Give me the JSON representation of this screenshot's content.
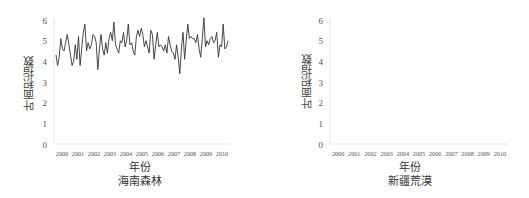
{
  "chart_data": [
    {
      "type": "line",
      "title": "海南森林",
      "xlabel": "年份",
      "ylabel": "叶面积指数",
      "ylim": [
        0,
        6
      ],
      "yticks": [
        0,
        1,
        2,
        3,
        4,
        5,
        6
      ],
      "categories": [
        "2000",
        "2001",
        "2002",
        "2003",
        "2004",
        "2005",
        "2006",
        "2007",
        "2008",
        "2009",
        "2010"
      ],
      "grid": false,
      "legend": null,
      "series": [
        {
          "name": "叶面积指数",
          "color": "#333333",
          "values": [
            4.3,
            3.8,
            4.2,
            5.1,
            4.6,
            4.5,
            4.9,
            5.3,
            4.8,
            4.3,
            3.8,
            4.0,
            4.8,
            4.1,
            5.2,
            3.8,
            4.6,
            5.4,
            5.8,
            4.5,
            4.9,
            4.6,
            4.8,
            5.3,
            5.2,
            4.9,
            3.6,
            4.6,
            5.3,
            4.6,
            4.3,
            4.9,
            4.4,
            5.1,
            5.4,
            5.0,
            5.9,
            4.8,
            4.6,
            4.4,
            5.0,
            4.9,
            5.4,
            4.7,
            5.0,
            5.8,
            4.8,
            4.9,
            4.5,
            4.3,
            5.2,
            5.5,
            5.2,
            5.6,
            5.3,
            4.7,
            5.0,
            4.7,
            4.4,
            5.5,
            5.3,
            4.1,
            4.8,
            5.4,
            4.7,
            4.8,
            4.7,
            4.5,
            4.8,
            4.4,
            5.2,
            4.8,
            4.5,
            4.4,
            4.1,
            4.8,
            4.2,
            3.4,
            4.6,
            5.4,
            4.1,
            5.0,
            5.8,
            5.1,
            5.2,
            5.1,
            5.1,
            4.9,
            5.3,
            4.6,
            4.2,
            5.1,
            6.1,
            4.7,
            5.0,
            4.8,
            5.1,
            5.2,
            4.9,
            5.0,
            5.4,
            4.2,
            4.8,
            4.7,
            5.8,
            4.6,
            4.7,
            5.0
          ]
        }
      ]
    },
    {
      "type": "line",
      "title": "新疆荒漠",
      "xlabel": "年份",
      "ylabel": "叶面积指数",
      "ylim": [
        0,
        6
      ],
      "yticks": [
        0,
        1,
        2,
        3,
        4,
        5,
        6
      ],
      "categories": [
        "2000",
        "2001",
        "2002",
        "2003",
        "2004",
        "2005",
        "2006",
        "2007",
        "2008",
        "2009",
        "2010"
      ],
      "grid": false,
      "legend": null,
      "series": []
    }
  ]
}
